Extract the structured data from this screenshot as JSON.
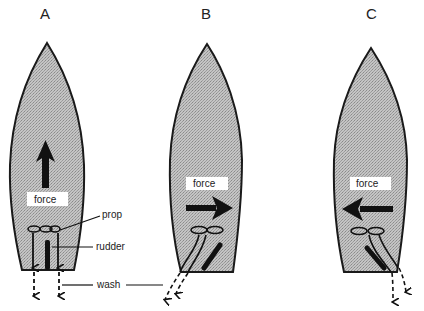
{
  "figure": {
    "panels": [
      {
        "id": "A",
        "label": "A",
        "force_label": "force",
        "force_direction": "forward",
        "rudder": "centered",
        "wash": "straight-back"
      },
      {
        "id": "B",
        "label": "B",
        "force_label": "force",
        "force_direction": "starboard",
        "rudder": "turned",
        "wash": "deflected-port"
      },
      {
        "id": "C",
        "label": "C",
        "force_label": "force",
        "force_direction": "port",
        "rudder": "turned",
        "wash": "deflected-starboard"
      }
    ],
    "callouts": {
      "prop": "prop",
      "rudder": "rudder",
      "wash": "wash"
    },
    "colors": {
      "hull_fill": "#b8b8b8",
      "hull_stroke": "#1a1a1a",
      "arrow": "#111111",
      "label_box": "#ffffff"
    }
  }
}
